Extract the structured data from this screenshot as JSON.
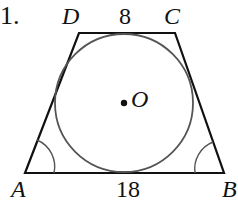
{
  "problem_number": "1.",
  "figure": {
    "type": "isosceles trapezoid with inscribed circle",
    "vertices": {
      "A": {
        "label": "A",
        "x": 25,
        "y": 173
      },
      "B": {
        "label": "B",
        "x": 224,
        "y": 173
      },
      "C": {
        "label": "C",
        "x": 175,
        "y": 33
      },
      "D": {
        "label": "D",
        "x": 79,
        "y": 33
      }
    },
    "center": {
      "label": "O",
      "x": 124,
      "y": 103
    },
    "radius": 68,
    "top_base_length": "8",
    "bottom_base_length": "18",
    "angle_marks": [
      "A",
      "B"
    ]
  },
  "colors": {
    "stroke": "#111111",
    "circle": "#555555"
  }
}
